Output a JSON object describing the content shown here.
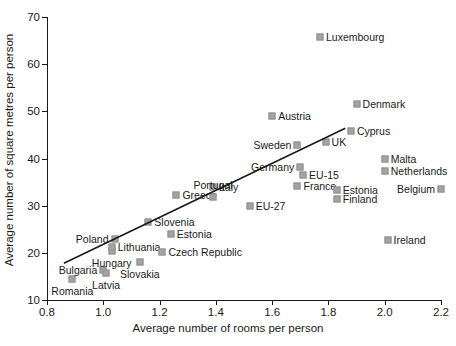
{
  "chart_data": {
    "type": "scatter",
    "title": "",
    "xlabel": "Average number of rooms per person",
    "ylabel": "Average number of square metres per person",
    "xlim": [
      0.8,
      2.2
    ],
    "ylim": [
      10,
      70
    ],
    "xticks": [
      "0.8",
      "1.0",
      "1.2",
      "1.4",
      "1.6",
      "1.8",
      "2.0",
      "2.2"
    ],
    "yticks": [
      "10",
      "20",
      "30",
      "40",
      "50",
      "60",
      "70"
    ],
    "grid": false,
    "legend": "none",
    "marker_color": "#a3a3a3",
    "axis_color": "#1a1a1a",
    "trendline": {
      "show": true,
      "x0": 0.86,
      "y0": 17.8,
      "x1": 1.86,
      "y1": 46.4
    },
    "points": [
      {
        "name": "Romania",
        "x": 0.89,
        "y": 14.5,
        "label_pos": "below"
      },
      {
        "name": "Bulgaria",
        "x": 1.0,
        "y": 16.3,
        "label_pos": "left"
      },
      {
        "name": "Latvia",
        "x": 1.01,
        "y": 15.8,
        "label_pos": "below"
      },
      {
        "name": "Hungary",
        "x": 1.03,
        "y": 20.3,
        "label_pos": "below"
      },
      {
        "name": "Lithuania",
        "x": 1.03,
        "y": 21.2,
        "label_pos": "right"
      },
      {
        "name": "Poland",
        "x": 1.04,
        "y": 23.0,
        "label_pos": "left"
      },
      {
        "name": "Slovakia",
        "x": 1.13,
        "y": 18.1,
        "label_pos": "below"
      },
      {
        "name": "Slovenia",
        "x": 1.16,
        "y": 26.5,
        "label_pos": "right"
      },
      {
        "name": "Czech Republic",
        "x": 1.21,
        "y": 20.1,
        "label_pos": "right"
      },
      {
        "name": "Greece",
        "x": 1.26,
        "y": 32.3,
        "label_pos": "right"
      },
      {
        "name": "Italy",
        "x": 1.39,
        "y": 33.9,
        "label_pos": "right"
      },
      {
        "name": "Portugal",
        "x": 1.39,
        "y": 31.9,
        "label_pos": "above"
      },
      {
        "name": "EU-27",
        "x": 1.52,
        "y": 30.0,
        "label_pos": "right"
      },
      {
        "name": "Austria",
        "x": 1.6,
        "y": 49.0,
        "label_pos": "right"
      },
      {
        "name": "Sweden",
        "x": 1.69,
        "y": 42.8,
        "label_pos": "left"
      },
      {
        "name": "Germany",
        "x": 1.7,
        "y": 38.2,
        "label_pos": "left"
      },
      {
        "name": "EU-15",
        "x": 1.71,
        "y": 36.5,
        "label_pos": "right"
      },
      {
        "name": "France",
        "x": 1.69,
        "y": 34.2,
        "label_pos": "right"
      },
      {
        "name": "Estonia",
        "x": 1.24,
        "y": 24.0,
        "label_pos": "right"
      },
      {
        "name": "Estonia-2",
        "x": 1.83,
        "y": 33.4,
        "label_pos": "right",
        "display": "Estonia"
      },
      {
        "name": "Finland",
        "x": 1.83,
        "y": 31.5,
        "label_pos": "right"
      },
      {
        "name": "UK",
        "x": 1.79,
        "y": 43.4,
        "label_pos": "right"
      },
      {
        "name": "Cyprus",
        "x": 1.88,
        "y": 45.8,
        "label_pos": "right"
      },
      {
        "name": "Denmark",
        "x": 1.9,
        "y": 51.5,
        "label_pos": "right"
      },
      {
        "name": "Malta",
        "x": 2.0,
        "y": 39.8,
        "label_pos": "right"
      },
      {
        "name": "Netherlands",
        "x": 2.0,
        "y": 37.3,
        "label_pos": "right"
      },
      {
        "name": "Belgium",
        "x": 2.2,
        "y": 33.5,
        "label_pos": "left"
      },
      {
        "name": "Ireland",
        "x": 2.01,
        "y": 22.8,
        "label_pos": "right"
      },
      {
        "name": "Luxembourg",
        "x": 1.77,
        "y": 65.8,
        "label_pos": "right"
      }
    ]
  }
}
